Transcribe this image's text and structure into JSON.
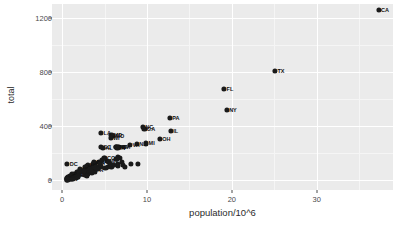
{
  "chart_data": {
    "type": "scatter",
    "title": "",
    "xlabel": "population/10^6",
    "ylabel": "total",
    "xlim": [
      -1.2,
      39.0
    ],
    "ylim": [
      -75,
      1300
    ],
    "grid": true,
    "legend": false,
    "xticks": [
      0,
      10,
      20,
      30
    ],
    "yticks": [
      0,
      400,
      800,
      1200
    ],
    "xtick_labels": [
      "0",
      "10",
      "20",
      "30"
    ],
    "ytick_labels": [
      "0",
      "400",
      "800",
      "1200"
    ],
    "point_color": "#1a1a1a",
    "panel_color": "#ebebeb",
    "grid_color": "#ffffff",
    "points": [
      {
        "label": "CA",
        "x": 37.3,
        "y": 1257
      },
      {
        "label": "TX",
        "x": 25.1,
        "y": 805
      },
      {
        "label": "FL",
        "x": 19.1,
        "y": 670
      },
      {
        "label": "NY",
        "x": 19.4,
        "y": 517
      },
      {
        "label": "GA",
        "x": 9.7,
        "y": 376
      },
      {
        "label": "NC",
        "x": 9.5,
        "y": 391
      },
      {
        "label": "IL",
        "x": 12.8,
        "y": 364
      },
      {
        "label": "PA",
        "x": 12.7,
        "y": 455
      },
      {
        "label": "OH",
        "x": 11.5,
        "y": 305
      },
      {
        "label": "MI",
        "x": 9.9,
        "y": 270
      },
      {
        "label": "NJ",
        "x": 8.8,
        "y": 263
      },
      {
        "label": "VA",
        "x": 8.0,
        "y": 256
      },
      {
        "label": "WA",
        "x": 6.7,
        "y": 241
      },
      {
        "label": "AZ",
        "x": 6.4,
        "y": 246
      },
      {
        "label": "MA",
        "x": 6.5,
        "y": 245
      },
      {
        "label": "TN",
        "x": 6.3,
        "y": 243
      },
      {
        "label": "IN",
        "x": 6.5,
        "y": 236
      },
      {
        "label": "MO",
        "x": 6.0,
        "y": 325
      },
      {
        "label": "MD",
        "x": 5.8,
        "y": 330
      },
      {
        "label": "WI",
        "x": 5.7,
        "y": 310
      },
      {
        "label": "LA",
        "x": 4.6,
        "y": 345
      },
      {
        "label": "SC",
        "x": 4.6,
        "y": 244
      },
      {
        "label": "AL",
        "x": 4.8,
        "y": 234
      },
      {
        "label": "CO",
        "x": 5.0,
        "y": 160
      },
      {
        "label": "MN",
        "x": 5.3,
        "y": 140
      },
      {
        "label": "KY",
        "x": 4.3,
        "y": 135
      },
      {
        "label": "OR",
        "x": 3.8,
        "y": 125
      },
      {
        "label": "OK",
        "x": 3.7,
        "y": 130
      },
      {
        "label": "CT",
        "x": 3.6,
        "y": 115
      },
      {
        "label": "IA",
        "x": 3.0,
        "y": 95
      },
      {
        "label": "MS",
        "x": 3.0,
        "y": 110
      },
      {
        "label": "AR",
        "x": 2.9,
        "y": 105
      },
      {
        "label": "KS",
        "x": 2.9,
        "y": 90
      },
      {
        "label": "UT",
        "x": 2.8,
        "y": 75
      },
      {
        "label": "NV",
        "x": 2.7,
        "y": 95
      },
      {
        "label": "NM",
        "x": 2.1,
        "y": 80
      },
      {
        "label": "WV",
        "x": 1.9,
        "y": 60
      },
      {
        "label": "NE",
        "x": 1.8,
        "y": 55
      },
      {
        "label": "ID",
        "x": 1.6,
        "y": 45
      },
      {
        "label": "ME",
        "x": 1.3,
        "y": 38
      },
      {
        "label": "NH",
        "x": 1.3,
        "y": 35
      },
      {
        "label": "HI",
        "x": 1.4,
        "y": 42
      },
      {
        "label": "RI",
        "x": 1.1,
        "y": 40
      },
      {
        "label": "MT",
        "x": 1.0,
        "y": 25
      },
      {
        "label": "DE",
        "x": 0.9,
        "y": 30
      },
      {
        "label": "SD",
        "x": 0.8,
        "y": 18
      },
      {
        "label": "AK",
        "x": 0.7,
        "y": 22
      },
      {
        "label": "ND",
        "x": 0.7,
        "y": 15
      },
      {
        "label": "VT",
        "x": 0.6,
        "y": 12
      },
      {
        "label": "WY",
        "x": 0.6,
        "y": 10
      },
      {
        "label": "DC",
        "x": 0.6,
        "y": 115
      },
      {
        "label": "PR",
        "x": 3.7,
        "y": 70
      },
      {
        "label": "NM2",
        "x": 2.0,
        "y": 48
      },
      {
        "label": "OK2",
        "x": 3.6,
        "y": 85
      },
      {
        "label": "IA2",
        "x": 3.1,
        "y": 62
      },
      {
        "label": "SC2",
        "x": 4.7,
        "y": 150
      },
      {
        "label": "AL2",
        "x": 4.9,
        "y": 165
      },
      {
        "label": "KY2",
        "x": 4.4,
        "y": 120
      },
      {
        "label": "LA2",
        "x": 4.5,
        "y": 100
      },
      {
        "label": "AZ2",
        "x": 6.6,
        "y": 170
      },
      {
        "label": "WA2",
        "x": 6.8,
        "y": 160
      },
      {
        "label": "TN2",
        "x": 6.4,
        "y": 155
      },
      {
        "label": "IN2",
        "x": 6.6,
        "y": 120
      },
      {
        "label": "MA2",
        "x": 6.6,
        "y": 105
      },
      {
        "label": "MD2",
        "x": 5.9,
        "y": 112
      },
      {
        "label": "WI2",
        "x": 5.8,
        "y": 100
      },
      {
        "label": "MO2",
        "x": 6.1,
        "y": 108
      },
      {
        "label": "MN2",
        "x": 5.4,
        "y": 95
      },
      {
        "label": "CO2",
        "x": 5.1,
        "y": 88
      },
      {
        "label": "VA2",
        "x": 8.1,
        "y": 120
      },
      {
        "label": "NJ2",
        "x": 8.9,
        "y": 118
      },
      {
        "label": "OR2",
        "x": 3.9,
        "y": 60
      },
      {
        "label": "CT2",
        "x": 3.5,
        "y": 55
      },
      {
        "label": "MS2",
        "x": 3.0,
        "y": 48
      },
      {
        "label": "AR2",
        "x": 2.9,
        "y": 42
      },
      {
        "label": "UT2",
        "x": 2.8,
        "y": 35
      },
      {
        "label": "NV2",
        "x": 2.7,
        "y": 38
      },
      {
        "label": "KS2",
        "x": 2.9,
        "y": 32
      },
      {
        "label": "WV2",
        "x": 1.9,
        "y": 25
      },
      {
        "label": "NE2",
        "x": 1.8,
        "y": 20
      },
      {
        "label": "ID2",
        "x": 1.6,
        "y": 18
      },
      {
        "label": "HI2",
        "x": 1.4,
        "y": 15
      },
      {
        "label": "ME2",
        "x": 1.3,
        "y": 12
      },
      {
        "label": "NH2",
        "x": 1.3,
        "y": 10
      },
      {
        "label": "RI2",
        "x": 1.1,
        "y": 8
      },
      {
        "label": "MT2",
        "x": 1.0,
        "y": 7
      },
      {
        "label": "DE2",
        "x": 0.9,
        "y": 6
      },
      {
        "label": "SD2",
        "x": 0.8,
        "y": 5
      },
      {
        "label": "AK2",
        "x": 0.7,
        "y": 5
      },
      {
        "label": "ND2",
        "x": 0.7,
        "y": 4
      },
      {
        "label": "VT2",
        "x": 0.6,
        "y": 3
      },
      {
        "label": "WY2",
        "x": 0.6,
        "y": 3
      },
      {
        "label": "a1",
        "x": 2.2,
        "y": 70
      },
      {
        "label": "a2",
        "x": 2.4,
        "y": 58
      },
      {
        "label": "a3",
        "x": 2.6,
        "y": 66
      },
      {
        "label": "a4",
        "x": 3.3,
        "y": 78
      },
      {
        "label": "a5",
        "x": 3.4,
        "y": 68
      },
      {
        "label": "a6",
        "x": 4.0,
        "y": 92
      },
      {
        "label": "a7",
        "x": 4.2,
        "y": 82
      },
      {
        "label": "a8",
        "x": 5.5,
        "y": 130
      },
      {
        "label": "a9",
        "x": 5.6,
        "y": 118
      },
      {
        "label": "a10",
        "x": 7.0,
        "y": 130
      },
      {
        "label": "a11",
        "x": 7.2,
        "y": 112
      },
      {
        "label": "a12",
        "x": 7.4,
        "y": 98
      }
    ]
  }
}
